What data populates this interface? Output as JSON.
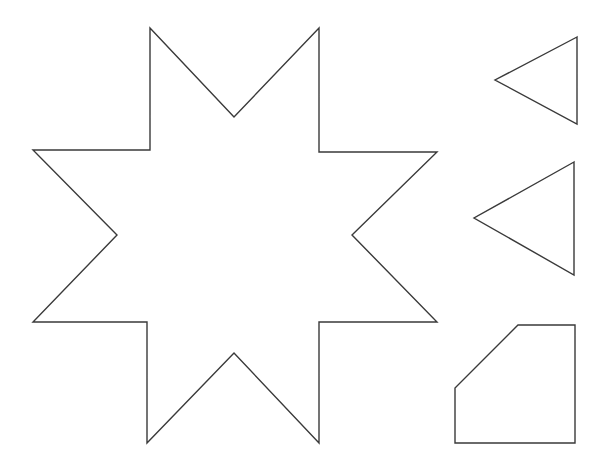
{
  "canvas": {
    "width": 606,
    "height": 470,
    "background_color": "#ffffff",
    "stroke_color": "#3a3a3a",
    "fill_color": "#ffffff",
    "stroke_width": 1.4
  },
  "figure": {
    "type": "line-drawing",
    "shape_count": 4
  },
  "shapes": [
    {
      "id": "star",
      "name": "eight-pointed-star",
      "label": "Eight-pointed star",
      "kind": "polygon",
      "point_count": 16,
      "outer_points": 8,
      "bounds": {
        "x": 33,
        "y": 28,
        "width": 404,
        "height": 415
      },
      "points": "150,28 234,117 319,28 319,152 437,152 352,235 437,322 319,322 319,443 234,353 147,443 147,322 33,322 117,235 33,150 150,150"
    },
    {
      "id": "triangle-small",
      "name": "left-pointing-triangle-small",
      "label": "Small left-pointing triangle",
      "kind": "polygon",
      "point_count": 3,
      "bounds": {
        "x": 495,
        "y": 37,
        "width": 82,
        "height": 87
      },
      "points": "577,37 495,80 577,124"
    },
    {
      "id": "triangle-large",
      "name": "left-pointing-triangle-large",
      "label": "Large left-pointing triangle",
      "kind": "polygon",
      "point_count": 3,
      "bounds": {
        "x": 474,
        "y": 162,
        "width": 100,
        "height": 113
      },
      "points": "574,162 474,218 574,275"
    },
    {
      "id": "pentagon",
      "name": "clipped-corner-pentagon",
      "label": "Square with cut top-left corner",
      "kind": "polygon",
      "point_count": 5,
      "bounds": {
        "x": 455,
        "y": 325,
        "width": 120,
        "height": 118
      },
      "points": "518,325 575,325 575,443 455,443 455,388"
    }
  ]
}
